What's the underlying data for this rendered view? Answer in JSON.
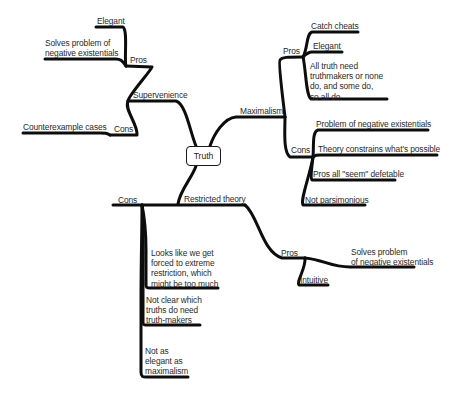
{
  "mindmap": {
    "root": "Truth",
    "branches": {
      "supervenience": {
        "label": "Supervenience",
        "pros": {
          "label": "Pros",
          "items": [
            "Elegant",
            "Solves problem of\nnegative existentials"
          ]
        },
        "cons": {
          "label": "Cons",
          "items": [
            "Counterexample cases"
          ]
        }
      },
      "maximalism": {
        "label": "Maximalism",
        "pros": {
          "label": "Pros",
          "items": [
            "Catch cheats",
            "Elegant",
            "All truth need\ntruthmakers or none\ndo, and some do,\nso all do."
          ]
        },
        "cons": {
          "label": "Cons",
          "items": [
            "Problem of negative existentials",
            "Theory constrains what's possible",
            "Pros all \"seem\" defetable",
            "Not parsimonious"
          ]
        }
      },
      "restricted": {
        "label": "Restricted theory",
        "cons": {
          "label": "Cons",
          "items": [
            "Looks like we get\nforced to extreme\nrestriction, which\nmight be too much",
            "Not clear which\ntruths do need\ntruth-makers",
            "Not as\nelegant as\nmaximalism"
          ]
        },
        "pros": {
          "label": "Pros",
          "items": [
            "Solves problem\nof negative existentials",
            "Intuitive"
          ]
        }
      }
    }
  },
  "colors": {
    "line": "#0d0d0d",
    "text": "#2a2a2a",
    "background": "#ffffff"
  }
}
